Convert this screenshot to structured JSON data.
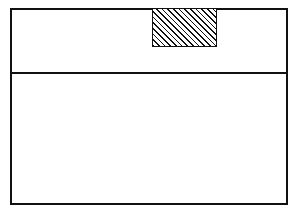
{
  "figure": {
    "background_color": "#ffffff",
    "line_color": "#111111",
    "canvas": {
      "width": 296,
      "height": 213
    }
  },
  "outer_frame": {
    "label": "",
    "x": 10,
    "y": 8,
    "width": 278,
    "height": 197,
    "stroke_width": 2,
    "stroke_color": "#111111",
    "fill_color": "#ffffff"
  },
  "divider": {
    "label": "",
    "orientation": "horizontal",
    "x": 10,
    "y": 72,
    "length": 278,
    "thickness": 2,
    "stroke_color": "#111111"
  },
  "hatched_block": {
    "label": "",
    "x": 152,
    "y": 8,
    "width": 65,
    "height": 39,
    "hatch_angle_deg": 45,
    "hatch_direction": "lower-left-to-upper-right",
    "hatch_spacing_px": 4,
    "hatch_line_width": 1,
    "stroke_width": 1,
    "stroke_color": "#111111",
    "fill_color": "#ffffff"
  },
  "zones": {
    "upper": {
      "label": "",
      "height": 64
    },
    "lower": {
      "label": "",
      "height": 131
    }
  }
}
